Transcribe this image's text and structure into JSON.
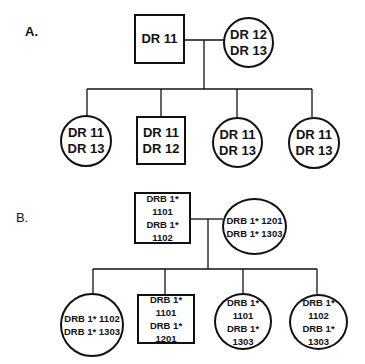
{
  "panels": [
    {
      "label": "A.",
      "father": {
        "shape": "square",
        "alleles": [
          "DR 11"
        ]
      },
      "mother": {
        "shape": "circle",
        "alleles": [
          "DR 12",
          "DR 13"
        ]
      },
      "children": [
        {
          "shape": "circle",
          "alleles": [
            "DR 11",
            "DR 13"
          ]
        },
        {
          "shape": "square",
          "alleles": [
            "DR 11",
            "DR 12"
          ]
        },
        {
          "shape": "circle",
          "alleles": [
            "DR 11",
            "DR 13"
          ]
        },
        {
          "shape": "circle",
          "alleles": [
            "DR 11",
            "DR 13"
          ]
        }
      ]
    },
    {
      "label": "B.",
      "father": {
        "shape": "square",
        "alleles": [
          "DRB 1* 1101",
          "DRB 1* 1102"
        ]
      },
      "mother": {
        "shape": "circle",
        "alleles": [
          "DRB 1* 1201",
          "DRB 1* 1303"
        ]
      },
      "children": [
        {
          "shape": "circle",
          "alleles": [
            "DRB 1* 1102",
            "DRB 1* 1303"
          ]
        },
        {
          "shape": "square",
          "alleles": [
            "DRB 1* 1101",
            "DRB 1* 1201"
          ]
        },
        {
          "shape": "circle",
          "alleles": [
            "DRB 1* 1101",
            "DRB 1* 1303"
          ]
        },
        {
          "shape": "circle",
          "alleles": [
            "DRB 1* 1102",
            "DRB 1* 1303"
          ]
        }
      ]
    }
  ],
  "colors": {
    "line": "#111111",
    "background": "#ffffff"
  }
}
